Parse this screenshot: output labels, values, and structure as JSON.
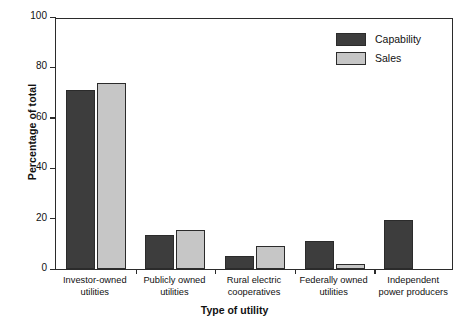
{
  "chart_data": {
    "type": "bar",
    "title": "",
    "xlabel": "Type of utility",
    "ylabel": "Percentage of total",
    "categories": [
      "Investor-owned\nutilities",
      "Publicly owned\nutilities",
      "Rural electric\ncooperatives",
      "Federally owned\nutilities",
      "Independent\npower producers"
    ],
    "category_lines": [
      [
        "Investor-owned",
        "utilities"
      ],
      [
        "Publicly owned",
        "utilities"
      ],
      [
        "Rural electric",
        "cooperatives"
      ],
      [
        "Federally owned",
        "utilities"
      ],
      [
        "Independent",
        "power producers"
      ]
    ],
    "series": [
      {
        "name": "Capability",
        "color": "#3d3d3d",
        "values": [
          71,
          13.5,
          5,
          11,
          19.5
        ]
      },
      {
        "name": "Sales",
        "color": "#c6c6c6",
        "values": [
          74,
          15.5,
          9,
          2,
          0
        ]
      }
    ],
    "ylim": [
      0,
      100
    ],
    "yticks": [
      0,
      20,
      40,
      60,
      80,
      100
    ],
    "ytick_labels": [
      "0",
      "20",
      "40",
      "60",
      "80",
      "100"
    ],
    "grid": false,
    "legend_position": "top-right"
  },
  "legend": {
    "entries": [
      {
        "label": "Capability",
        "swatch": "capability"
      },
      {
        "label": "Sales",
        "swatch": "sales"
      }
    ]
  },
  "axes": {
    "y_title": "Percentage of total",
    "x_title": "Type of utility"
  }
}
